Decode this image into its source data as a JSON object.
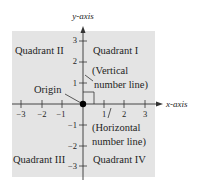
{
  "diagram": {
    "axes": {
      "x_label": "x-axis",
      "y_label": "y-axis",
      "x_ticks": [
        "−3",
        "−2",
        "−1",
        "1",
        "2",
        "3"
      ],
      "y_ticks": [
        "3",
        "2",
        "1",
        "−1",
        "−2",
        "−3"
      ]
    },
    "quadrants": {
      "q1": "Quadrant I",
      "q2": "Quadrant II",
      "q3": "Quadrant III",
      "q4": "Quadrant IV"
    },
    "annotations": {
      "origin": "Origin",
      "vertical_line_1": "(Vertical",
      "vertical_line_2": "number line)",
      "horizontal_line_1": "(Horizontal",
      "horizontal_line_2": "number line)"
    },
    "colors": {
      "plane_fill": "#e4e4e4",
      "axis": "#333333",
      "origin_dot": "#000000"
    }
  }
}
